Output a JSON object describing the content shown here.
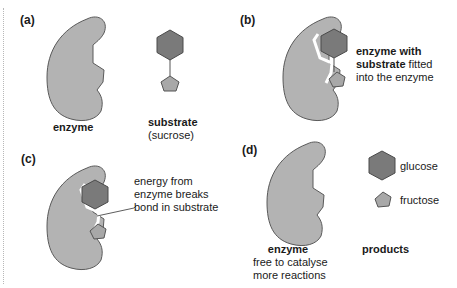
{
  "colors": {
    "enzyme_fill": "#b3b3b3",
    "enzyme_stroke": "#5a5a5a",
    "glucose_fill": "#7a7a7a",
    "fructose_fill": "#a8a8a8",
    "text": "#1a1a1a"
  },
  "panels": {
    "a": {
      "label": "(a)",
      "enzyme_caption": "enzyme",
      "substrate_caption": "substrate",
      "substrate_sub": "(sucrose)"
    },
    "b": {
      "label": "(b)",
      "caption_bold_1": "enzyme with",
      "caption_bold_2": "substrate",
      "caption_rest_2": " fitted",
      "caption_line_3": "into the enzyme"
    },
    "c": {
      "label": "(c)",
      "caption_line_1": "energy from",
      "caption_line_2": "enzyme breaks",
      "caption_line_3": "bond in substrate"
    },
    "d": {
      "label": "(d)",
      "enzyme_caption": "enzyme",
      "enzyme_sub_1": "free to catalyse",
      "enzyme_sub_2": "more reactions",
      "glucose_label": "glucose",
      "fructose_label": "fructose",
      "products_caption": "products"
    }
  }
}
